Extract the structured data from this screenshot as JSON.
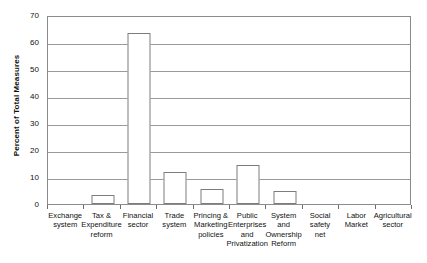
{
  "chart_data": {
    "type": "bar",
    "title": "",
    "xlabel": "",
    "ylabel": "Percent of Total Measures",
    "ylim": [
      0,
      70
    ],
    "ytick_values": [
      70,
      60,
      50,
      40,
      30,
      20,
      10,
      0
    ],
    "ytick_labels": [
      "70",
      "60",
      "50",
      "40",
      "30",
      "20",
      "10",
      "0"
    ],
    "grid": true,
    "legend": "none",
    "bar_style": {
      "fill": "#ffffff",
      "edge": "#7d7d7d",
      "plot_border": "#8b8b8b",
      "gridline": "#9a9a9a"
    },
    "categories": [
      "Exchange system",
      "Tax & Expenditure reform",
      "Financial sector",
      "Trade system",
      "Princing & Marketing policies",
      "Public Enterprises and Privatization",
      "System and Ownership Reform",
      "Social safety net",
      "Labor Market",
      "Agricultural sector"
    ],
    "values": [
      0,
      3.2,
      63.5,
      11.8,
      5.6,
      14.4,
      5.0,
      0,
      0,
      0
    ]
  },
  "x_labels": [
    {
      "lines": [
        "Exchange",
        "system"
      ]
    },
    {
      "lines": [
        "Tax &",
        "Expenditure",
        "reform"
      ]
    },
    {
      "lines": [
        "Financial",
        "sector"
      ]
    },
    {
      "lines": [
        "Trade",
        "system"
      ]
    },
    {
      "lines": [
        "Princing &",
        "Marketing",
        "policies"
      ]
    },
    {
      "lines": [
        "Public",
        "Enterprises",
        "and",
        "Privatization"
      ]
    },
    {
      "lines": [
        "System",
        "and",
        "Ownership",
        "Reform"
      ]
    },
    {
      "lines": [
        "Social",
        "safety",
        "net"
      ]
    },
    {
      "lines": [
        "Labor",
        "Market"
      ]
    },
    {
      "lines": [
        "Agricultural",
        "sector"
      ]
    }
  ]
}
